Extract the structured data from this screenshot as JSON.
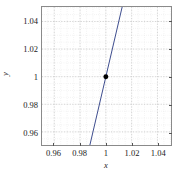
{
  "chart_data": {
    "type": "line",
    "title": "",
    "xlabel": "x",
    "ylabel": "y",
    "xlim": [
      0.9505,
      1.0505
    ],
    "ylim": [
      0.9505,
      1.0505
    ],
    "grid": true,
    "minor_grid": true,
    "legend": "none",
    "xticks": [
      0.96,
      0.98,
      1,
      1.02,
      1.04
    ],
    "yticks": [
      0.96,
      0.98,
      1,
      1.02,
      1.04
    ],
    "xtick_labels": [
      "0.96",
      "0.98",
      "1",
      "1.02",
      "1.04"
    ],
    "ytick_labels": [
      "0.96",
      "0.98",
      "1",
      "1.02",
      "1.04"
    ],
    "minor_tick_step": 0.005,
    "series": [
      {
        "name": "line",
        "type": "line",
        "color": "#3b4a8c",
        "linewidth": 1,
        "slope": 4.0,
        "intercept": -3.0,
        "x": [
          0.9875,
          1.0255
        ],
        "y": [
          0.95,
          1.102
        ],
        "x_visible_range": [
          0.9876,
          1.0256
        ],
        "comment_points": [
          [
            0.9876,
            0.9505
          ],
          [
            1.0,
            1.0
          ],
          [
            1.0256,
            1.0505
          ]
        ]
      },
      {
        "name": "marker-point",
        "type": "scatter",
        "color": "#000000",
        "marker": "filled-circle",
        "marker_size": 5,
        "x": [
          1.0
        ],
        "y": [
          1.0
        ]
      }
    ],
    "colors": {
      "line": "#3b4a8c",
      "marker": "#000000",
      "grid_major": "#c9c9c9",
      "grid_minor": "#dedede",
      "axis_frame": "#8a8a8a",
      "background": "#ffffff",
      "text": "#1a1a1a"
    }
  }
}
